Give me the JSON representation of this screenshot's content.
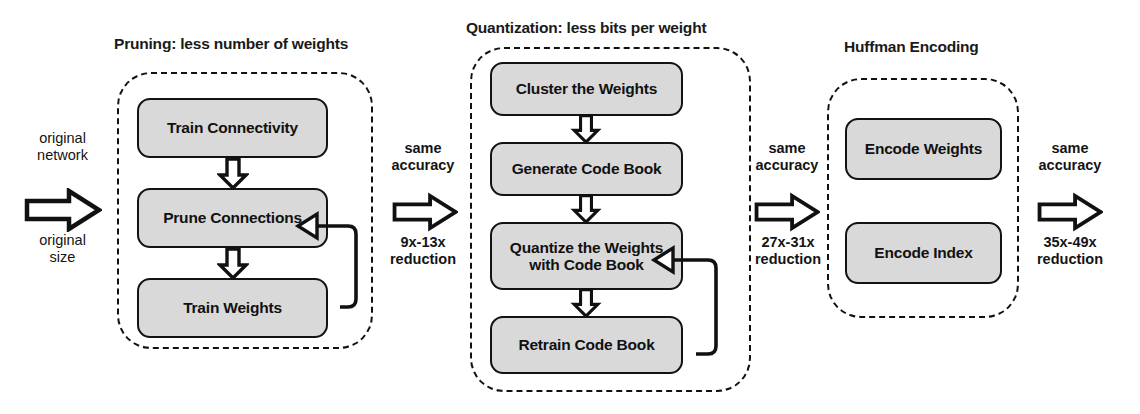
{
  "diagram": {
    "type": "flow-diagram",
    "colors": {
      "box_fill": "#d9d9d9",
      "stroke": "#111111",
      "background": "#ffffff"
    }
  },
  "stages": [
    {
      "id": "pruning",
      "title": "Pruning: less number of weights",
      "steps": [
        {
          "label": "Train Connectivity"
        },
        {
          "label": "Prune Connections"
        },
        {
          "label": "Train Weights"
        }
      ],
      "feedback_from": "Train Weights",
      "feedback_to": "Prune Connections"
    },
    {
      "id": "quantization",
      "title": "Quantization: less bits per weight",
      "steps": [
        {
          "label": "Cluster the Weights"
        },
        {
          "label": "Generate Code Book"
        },
        {
          "label": "Quantize the Weights with Code Book"
        },
        {
          "label": "Retrain Code Book"
        }
      ],
      "feedback_from": "Retrain Code Book",
      "feedback_to": "Quantize the Weights with Code Book"
    },
    {
      "id": "huffman",
      "title": "Huffman Encoding",
      "steps": [
        {
          "label": "Encode Weights"
        },
        {
          "label": "Encode Index"
        }
      ]
    }
  ],
  "transitions": [
    {
      "id": "input",
      "top_line1": "original",
      "top_line2": "network",
      "bottom_line1": "original",
      "bottom_line2": "size",
      "bold": false
    },
    {
      "id": "after-pruning",
      "top_line1": "same",
      "top_line2": "accuracy",
      "bottom_line1": "9x-13x",
      "bottom_line2": "reduction",
      "bold": true
    },
    {
      "id": "after-quantization",
      "top_line1": "same",
      "top_line2": "accuracy",
      "bottom_line1": "27x-31x",
      "bottom_line2": "reduction",
      "bold": true
    },
    {
      "id": "after-huffman",
      "top_line1": "same",
      "top_line2": "accuracy",
      "bottom_line1": "35x-49x",
      "bottom_line2": "reduction",
      "bold": true
    }
  ]
}
